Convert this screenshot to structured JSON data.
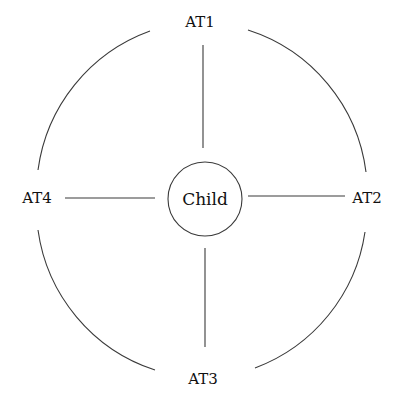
{
  "diagram": {
    "center_node": {
      "label": "Child"
    },
    "outer_nodes": [
      {
        "id": "top",
        "label": "AT1"
      },
      {
        "id": "right",
        "label": "AT2"
      },
      {
        "id": "bottom",
        "label": "AT3"
      },
      {
        "id": "left",
        "label": "AT4"
      }
    ],
    "edges": [
      {
        "from": "Child",
        "to": "AT1"
      },
      {
        "from": "Child",
        "to": "AT2"
      },
      {
        "from": "Child",
        "to": "AT3"
      },
      {
        "from": "Child",
        "to": "AT4"
      }
    ],
    "arcs": [
      {
        "from": "AT1",
        "to": "AT4"
      },
      {
        "from": "AT1",
        "to": "AT2"
      },
      {
        "from": "AT4",
        "to": "AT3"
      },
      {
        "from": "AT2",
        "to": "AT3"
      }
    ],
    "colors": {
      "line": "#3a3a3a",
      "text": "#111111",
      "background": "#ffffff"
    }
  }
}
